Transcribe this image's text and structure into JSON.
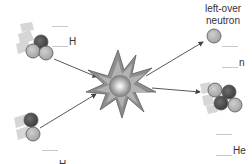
{
  "diagram": {
    "type": "nuclear-fusion-reaction",
    "reactants": [
      {
        "id": "tritium",
        "symbol": "H",
        "protons": 1,
        "neutrons": 2,
        "blanks": [
          "mass-number",
          "atomic-number"
        ]
      },
      {
        "id": "deuterium",
        "symbol": "H",
        "protons": 1,
        "neutrons": 1,
        "blanks": [
          "mass-number",
          "atomic-number"
        ]
      }
    ],
    "products": [
      {
        "id": "neutron",
        "symbol": "n",
        "caption": "left-over\nneutron",
        "neutrons": 1,
        "blanks": [
          "mass-number",
          "atomic-number"
        ]
      },
      {
        "id": "helium",
        "symbol": "He",
        "protons": 2,
        "neutrons": 2,
        "blanks": [
          "mass-number",
          "atomic-number"
        ]
      }
    ],
    "labels": {
      "top_left_symbol": "H",
      "bottom_left_symbol": "H",
      "neutron_caption_line1": "left-over",
      "neutron_caption_line2": "neutron",
      "neutron_symbol": "n",
      "helium_symbol": "He"
    },
    "colors": {
      "proton": "#6a6a6a",
      "neutron": "#b5b5b5",
      "outline": "#555555",
      "arrow": "#444444",
      "star_fill": "#9a9a9a",
      "blank_line": "#c8c8c8",
      "motion_trail": "#d6d6d6"
    }
  }
}
